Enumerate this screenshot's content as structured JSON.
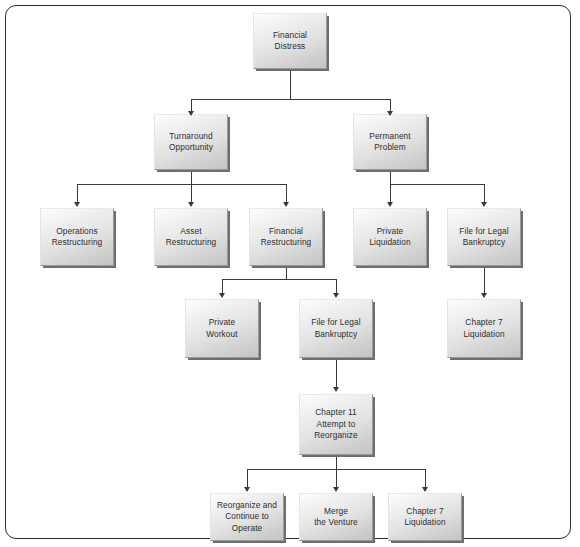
{
  "diagram": {
    "type": "flowchart",
    "nodes": {
      "financial_distress": "Financial\nDistress",
      "turnaround_opportunity": "Turnaround\nOpportunity",
      "permanent_problem": "Permanent\nProblem",
      "operations_restructuring": "Operations\nRestructuring",
      "asset_restructuring": "Asset\nRestructuring",
      "financial_restructuring": "Financial\nRestructuring",
      "private_liquidation": "Private\nLiquidation",
      "file_for_legal_bankruptcy_right": "File for Legal\nBankruptcy",
      "private_workout": "Private\nWorkout",
      "file_for_legal_bankruptcy_center": "File for Legal\nBankruptcy",
      "chapter_7_liquidation_right": "Chapter 7\nLiquidation",
      "chapter_11_attempt_to_reorganize": "Chapter 11\nAttempt to\nReorganize",
      "reorganize_and_continue": "Reorganize and\nContinue to\nOperate",
      "merge_the_venture": "Merge\nthe Venture",
      "chapter_7_liquidation_bottom": "Chapter 7\nLiquidation"
    },
    "edges": [
      {
        "from": "financial_distress",
        "to": "turnaround_opportunity"
      },
      {
        "from": "financial_distress",
        "to": "permanent_problem"
      },
      {
        "from": "turnaround_opportunity",
        "to": "operations_restructuring"
      },
      {
        "from": "turnaround_opportunity",
        "to": "asset_restructuring"
      },
      {
        "from": "turnaround_opportunity",
        "to": "financial_restructuring"
      },
      {
        "from": "permanent_problem",
        "to": "private_liquidation"
      },
      {
        "from": "permanent_problem",
        "to": "file_for_legal_bankruptcy_right"
      },
      {
        "from": "financial_restructuring",
        "to": "private_workout"
      },
      {
        "from": "financial_restructuring",
        "to": "file_for_legal_bankruptcy_center"
      },
      {
        "from": "file_for_legal_bankruptcy_right",
        "to": "chapter_7_liquidation_right"
      },
      {
        "from": "file_for_legal_bankruptcy_center",
        "to": "chapter_11_attempt_to_reorganize"
      },
      {
        "from": "chapter_11_attempt_to_reorganize",
        "to": "reorganize_and_continue"
      },
      {
        "from": "chapter_11_attempt_to_reorganize",
        "to": "merge_the_venture"
      },
      {
        "from": "chapter_11_attempt_to_reorganize",
        "to": "chapter_7_liquidation_bottom"
      }
    ],
    "colors": {
      "border": "#2b2b2b",
      "connector": "#3a3a3a",
      "box_light": "#fdfdfd",
      "box_dark": "#c4c4c4",
      "text": "#2d2d2d",
      "background": "#ffffff"
    }
  }
}
